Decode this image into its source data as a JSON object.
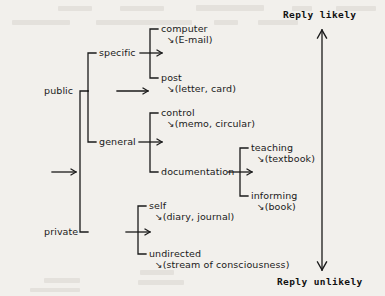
{
  "diagram": {
    "type": "tree",
    "title": "",
    "background_color": "#f2f0ec",
    "ink_color": "#1a1a1a",
    "root": {
      "label": "",
      "arrow": "→"
    },
    "branch_glyph": "↘",
    "nodes": {
      "public": {
        "label": "public"
      },
      "private": {
        "label": "private"
      },
      "specific": {
        "label": "specific"
      },
      "general": {
        "label": "general"
      },
      "computer": {
        "label": "computer",
        "gloss": "(E-mail)"
      },
      "post": {
        "label": "post",
        "gloss": "(letter, card)"
      },
      "control": {
        "label": "control",
        "gloss": "(memo, circular)"
      },
      "documentation": {
        "label": "documentation"
      },
      "teaching": {
        "label": "teaching",
        "gloss": "(textbook)"
      },
      "informing": {
        "label": "informing",
        "gloss": "(book)"
      },
      "self": {
        "label": "self",
        "gloss": "(diary, journal)"
      },
      "undirected": {
        "label": "undirected",
        "gloss": "(stream of consciousness)"
      }
    },
    "scale": {
      "top_label": "Reply likely",
      "bottom_label": "Reply unlikely",
      "orientation": "vertical",
      "arrowheads": "both"
    }
  }
}
